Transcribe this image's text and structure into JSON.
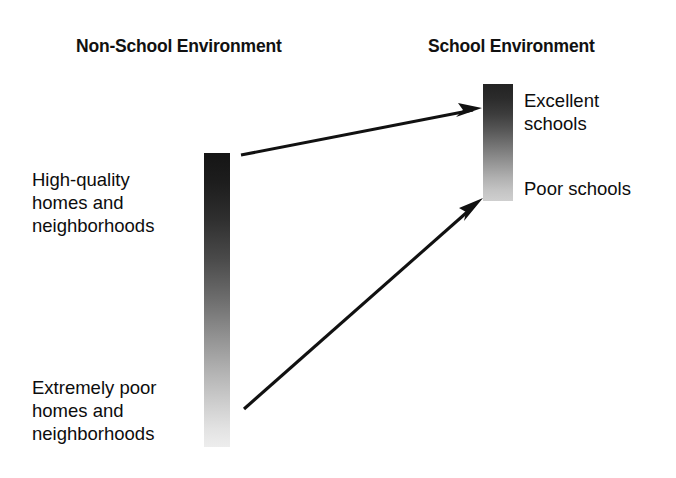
{
  "diagram": {
    "title_left": "Non-School Environment",
    "title_right": "School Environment",
    "columns": {
      "non_school": {
        "heading": "Non-School Environment",
        "bar": {
          "name": "non-school-gradient-bar",
          "top_tone": "#151515",
          "bottom_tone": "#ededed",
          "top_label": "High-quality\nhomes and\nneighborhoods",
          "bottom_label": "Extremely poor\nhomes and\nneighborhoods"
        }
      },
      "school": {
        "heading": "School Environment",
        "bar": {
          "name": "school-gradient-bar",
          "top_tone": "#232323",
          "bottom_tone": "#cfcfcf",
          "top_label": "Excellent\nschools",
          "bottom_label": "Poor schools"
        }
      }
    },
    "arrows": [
      {
        "name": "arrow-high-quality-to-excellent-schools",
        "from": "High-quality homes and neighborhoods",
        "to": "Excellent schools"
      },
      {
        "name": "arrow-extremely-poor-to-poor-schools",
        "from": "Extremely poor homes and neighborhoods",
        "to": "Poor schools"
      }
    ],
    "colors": {
      "background": "#ffffff",
      "text": "#0d0d0d",
      "arrow": "#111111"
    }
  }
}
